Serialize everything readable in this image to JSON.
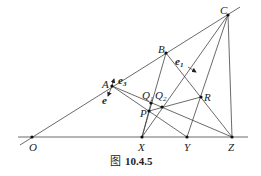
{
  "figure": {
    "caption_prefix": "图",
    "caption_number": "10.4.5",
    "points": {
      "O": {
        "label": "O",
        "x": 32,
        "y": 137
      },
      "X": {
        "label": "X",
        "x": 142,
        "y": 137
      },
      "Y": {
        "label": "Y",
        "x": 187,
        "y": 137
      },
      "Z": {
        "label": "Z",
        "x": 232,
        "y": 137
      },
      "A": {
        "label": "A",
        "x": 112,
        "y": 86
      },
      "B": {
        "label": "B",
        "x": 166,
        "y": 53
      },
      "C": {
        "label": "C",
        "x": 228,
        "y": 15
      },
      "P": {
        "label": "P",
        "x": 149,
        "y": 111
      },
      "Q1": {
        "label": "Q",
        "sub": "1",
        "x": 151,
        "y": 103
      },
      "Q2": {
        "label": "Q",
        "sub": "2",
        "x": 162,
        "y": 107
      },
      "R": {
        "label": "R",
        "x": 201,
        "y": 97
      }
    },
    "vectors": {
      "e1": {
        "label": "e",
        "sub": "1"
      },
      "e3": {
        "label": "e",
        "sub": "3"
      },
      "e": {
        "label": "e"
      }
    }
  }
}
